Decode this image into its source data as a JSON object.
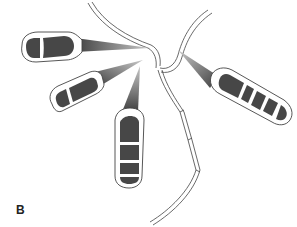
{
  "figure": {
    "panel_label": "B",
    "colors": {
      "background": "#ffffff",
      "cell_fill": "#474747",
      "outline": "#3a3a3a",
      "stalk_dark": "#444444",
      "stalk_light": "#bdbdbd"
    },
    "conidia": [
      {
        "name": "conidium-top-left",
        "cells": 2
      },
      {
        "name": "conidium-middle-left",
        "cells": 3
      },
      {
        "name": "conidium-bottom-center",
        "cells": 4
      },
      {
        "name": "conidium-right",
        "cells": 5
      }
    ]
  }
}
